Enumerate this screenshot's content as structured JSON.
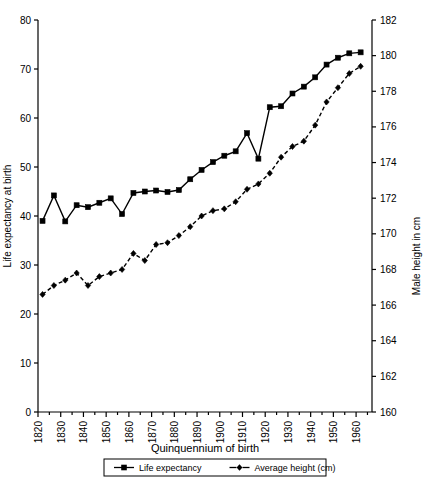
{
  "chart_data": {
    "type": "line",
    "title": "",
    "xlabel": "Quinquennium of birth",
    "ylabel": "Life expectancy at birth",
    "ylabel_right": "Male height in cm",
    "xlim": [
      1820,
      1967
    ],
    "ylim": [
      0,
      80
    ],
    "ylim_right": [
      160,
      182
    ],
    "ytick_step": 10,
    "ytick_right_step": 2,
    "xtick_major_step": 10,
    "xtick_minor_step": 5,
    "grid": false,
    "legend_position": "bottom-center",
    "x_ticks": [
      "1820",
      "1830",
      "1840",
      "1850",
      "1860",
      "1870",
      "1880",
      "1890",
      "1900",
      "1910",
      "1920",
      "1930",
      "1940",
      "1950",
      "1960"
    ],
    "y_ticks_left": [
      "0",
      "10",
      "20",
      "30",
      "40",
      "50",
      "60",
      "70",
      "80"
    ],
    "y_ticks_right": [
      "160",
      "162",
      "164",
      "166",
      "168",
      "170",
      "172",
      "174",
      "176",
      "178",
      "180",
      "182"
    ],
    "x": [
      1822,
      1827,
      1832,
      1837,
      1842,
      1847,
      1852,
      1857,
      1862,
      1867,
      1872,
      1877,
      1882,
      1887,
      1892,
      1897,
      1902,
      1907,
      1912,
      1917,
      1922,
      1927,
      1932,
      1937,
      1942,
      1947,
      1952,
      1957,
      1962
    ],
    "series": [
      {
        "name": "Life expectancy",
        "axis": "left",
        "marker": "square",
        "line": "solid",
        "color": "#000000",
        "values": [
          39.0,
          44.2,
          38.9,
          42.2,
          41.8,
          42.7,
          43.6,
          40.4,
          44.7,
          45.0,
          45.2,
          44.9,
          45.3,
          47.5,
          49.4,
          51.0,
          52.3,
          53.2,
          56.9,
          51.7,
          62.2,
          62.4,
          65.0,
          66.4,
          68.3,
          70.9,
          72.3,
          73.2,
          73.4
        ]
      },
      {
        "name": "Average height (cm)",
        "axis": "right",
        "marker": "diamond",
        "line": "dashed",
        "color": "#000000",
        "values": [
          166.6,
          167.1,
          167.4,
          167.8,
          167.1,
          167.6,
          167.8,
          168.0,
          168.9,
          168.5,
          169.4,
          169.5,
          169.9,
          170.4,
          171.0,
          171.3,
          171.4,
          171.8,
          172.5,
          172.8,
          173.4,
          174.3,
          174.9,
          175.2,
          176.1,
          177.4,
          178.2,
          179.0,
          179.4
        ]
      }
    ],
    "legend": [
      {
        "label": "Life expectancy",
        "marker": "square",
        "line": "solid"
      },
      {
        "label": "Average height (cm)",
        "marker": "diamond",
        "line": "dashed"
      }
    ]
  }
}
